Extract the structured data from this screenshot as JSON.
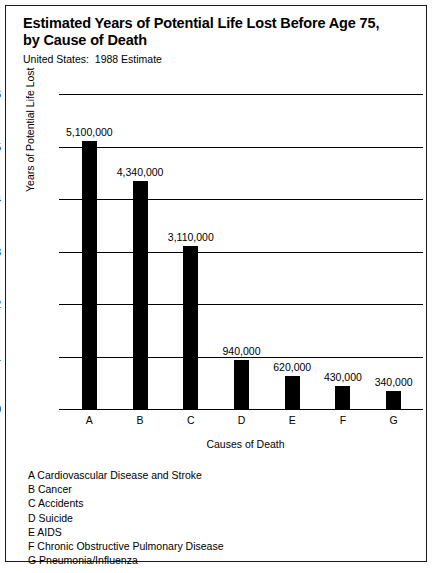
{
  "chart_data": {
    "type": "bar",
    "title": "Estimated Years of Potential Life Lost Before Age 75,\nby Cause of Death",
    "subtitle": "United States:  1988 Estimate",
    "xlabel": "Causes of Death",
    "ylabel": "Years of Potential Life Lost",
    "categories": [
      "A",
      "B",
      "C",
      "D",
      "E",
      "F",
      "G"
    ],
    "values": [
      5.1,
      4.34,
      3.11,
      0.94,
      0.62,
      0.43,
      0.34
    ],
    "value_labels": [
      "5,100,000",
      "4,340,000",
      "3,110,000",
      "940,000",
      "620,000",
      "430,000",
      "340,000"
    ],
    "ylim": [
      0,
      6
    ],
    "yticks": [
      0,
      1,
      2,
      3,
      4,
      5,
      6
    ],
    "ytick_labels": [
      "0",
      "1",
      "2",
      "3",
      "4",
      "5",
      "6"
    ],
    "units": "millions of years",
    "grid": true,
    "legend_position": "below-plot",
    "bar_color": "#000000",
    "series_name": "Years of Potential Life Lost"
  },
  "legend": {
    "entries": [
      {
        "key": "A",
        "label": "A Cardiovascular Disease and Stroke"
      },
      {
        "key": "B",
        "label": "B Cancer"
      },
      {
        "key": "C",
        "label": "C Accidents"
      },
      {
        "key": "D",
        "label": "D Suicide"
      },
      {
        "key": "E",
        "label": "E AIDS"
      },
      {
        "key": "F",
        "label": "F Chronic Obstructive Pulmonary Disease"
      },
      {
        "key": "G",
        "label": "G Pneumonia/Influenza"
      }
    ]
  }
}
